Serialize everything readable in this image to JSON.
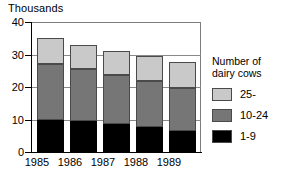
{
  "chart_data": {
    "type": "bar",
    "subtype": "stacked-bar",
    "title": "Thousands",
    "xlabel": "",
    "ylabel": "Thousands",
    "ylim": [
      0,
      40
    ],
    "yticks": [
      0,
      10,
      20,
      30,
      40
    ],
    "ytick_labels": [
      "0",
      "10",
      "20",
      "30",
      "40"
    ],
    "grid": true,
    "grid_axis": "y",
    "legend_position": "right",
    "legend_title": "Number of dairy cows",
    "legend_title_lines": [
      "Number of",
      "dairy cows"
    ],
    "categories": [
      "1985",
      "1986",
      "1987",
      "1988",
      "1989"
    ],
    "series": [
      {
        "name": "1-9",
        "color": "#000000",
        "values": [
          10.0,
          9.4,
          8.6,
          7.7,
          6.5
        ]
      },
      {
        "name": "10-24",
        "color": "#767676",
        "values": [
          17.0,
          16.0,
          15.1,
          14.3,
          13.2
        ]
      },
      {
        "name": "25-",
        "color": "#c9c9c9",
        "values": [
          8.2,
          7.6,
          7.3,
          7.5,
          8.0
        ]
      }
    ],
    "totals": [
      35.2,
      33.0,
      31.0,
      29.5,
      27.7
    ]
  },
  "colors": {
    "top_band": "#c9c9c9",
    "mid_band": "#767676",
    "bottom_band": "#000000",
    "axis": "#000000",
    "grid": "#8a8a8a",
    "background": "#ffffff"
  },
  "axis": {
    "title": "Thousands",
    "y_labels": [
      "40",
      "30",
      "20",
      "10",
      "0"
    ],
    "x_labels": [
      "1985",
      "1986",
      "1987",
      "1988",
      "1989"
    ]
  },
  "legend": {
    "title_line1": "Number of",
    "title_line2": "dairy cows",
    "items": [
      {
        "label": "25-",
        "color": "#c9c9c9"
      },
      {
        "label": "10-24",
        "color": "#767676"
      },
      {
        "label": "1-9",
        "color": "#000000"
      }
    ]
  }
}
